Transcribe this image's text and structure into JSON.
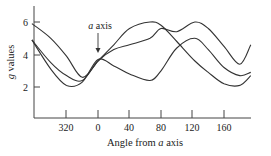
{
  "chart_data": {
    "type": "line",
    "title": "",
    "xlabel": "Angle from a axis",
    "ylabel": "g values",
    "x_ticks": [
      320,
      0,
      40,
      80,
      120,
      160
    ],
    "x_ticks_unwrapped": [
      -40,
      0,
      40,
      80,
      120,
      160
    ],
    "y_ticks": [
      2,
      4,
      6
    ],
    "xlim": [
      -84,
      194
    ],
    "ylim": [
      1,
      7
    ],
    "grid": false,
    "legend": null,
    "annotations": [
      {
        "text": "a axis",
        "x": 0,
        "arrow_to_y": 3.7
      }
    ],
    "series": [
      {
        "name": "curve-1",
        "model": "4 + 2*cos(2*(theta-66))",
        "x": [
          -84,
          -60,
          -40,
          -20,
          0,
          20,
          40,
          66,
          80,
          100,
          123,
          140,
          160,
          180,
          194
        ],
        "values": [
          5.9,
          5.0,
          3.9,
          2.6,
          3.6,
          4.6,
          5.6,
          6.0,
          5.8,
          4.8,
          3.6,
          2.9,
          2.2,
          2.1,
          2.7
        ]
      },
      {
        "name": "curve-2",
        "model": "4 + 2*cos(2*(theta-123))",
        "x": [
          -84,
          -60,
          -40,
          -20,
          0,
          20,
          40,
          66,
          80,
          100,
          123,
          140,
          160,
          180,
          194
        ],
        "values": [
          4.9,
          3.5,
          2.7,
          2.4,
          3.6,
          4.3,
          4.6,
          5.0,
          5.6,
          5.4,
          6.0,
          5.6,
          4.5,
          3.4,
          4.6
        ]
      },
      {
        "name": "curve-3",
        "model": "lower sinusoid with min near 320",
        "x": [
          -84,
          -60,
          -40,
          -20,
          0,
          20,
          40,
          66,
          80,
          100,
          123,
          140,
          160,
          180,
          194
        ],
        "values": [
          4.9,
          3.1,
          2.1,
          2.3,
          3.7,
          3.3,
          2.8,
          2.4,
          3.0,
          4.4,
          5.0,
          4.3,
          3.2,
          2.7,
          2.9
        ]
      }
    ]
  },
  "labels": {
    "ylabel": "g values",
    "xlabel_prefix": "Angle from ",
    "xlabel_italic": "a",
    "xlabel_suffix": " axis",
    "annotation_italic": "a",
    "annotation_suffix": " axis",
    "yticks": [
      "6",
      "4",
      "2"
    ],
    "xticks": [
      "320",
      "0",
      "40",
      "80",
      "120",
      "160"
    ]
  },
  "colors": {
    "line": "#333333",
    "axis": "#444444",
    "text": "#222222",
    "background": "#ffffff"
  }
}
